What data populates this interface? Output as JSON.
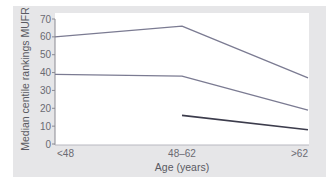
{
  "chart_data": {
    "type": "line",
    "title": "",
    "xlabel": "Age (years)",
    "ylabel": "Median centile rankings MUFR",
    "categories": [
      "<48",
      "48–62",
      ">62"
    ],
    "ylim": [
      0,
      70
    ],
    "yticks": [
      0,
      10,
      20,
      30,
      40,
      50,
      60,
      70
    ],
    "grid": false,
    "legend": "none",
    "series": [
      {
        "name": "upper",
        "values": [
          60,
          66,
          37
        ],
        "color": "#7b7b92"
      },
      {
        "name": "middle",
        "values": [
          39,
          38,
          19
        ],
        "color": "#7b7b92"
      },
      {
        "name": "lower",
        "values": [
          null,
          16,
          8
        ],
        "color": "#3c3c4c"
      }
    ]
  },
  "colors": {
    "panel_background": "#e6e6e8",
    "plot_background": "#ffffff",
    "axis": "#8a8a92"
  }
}
